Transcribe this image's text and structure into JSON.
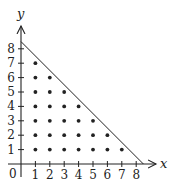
{
  "chart_data": {
    "type": "scatter",
    "title": "",
    "xlabel": "x",
    "ylabel": "y",
    "origin_label": "0",
    "xlim": [
      0,
      9
    ],
    "ylim": [
      0,
      9
    ],
    "grid": false,
    "x_ticks": [
      "1",
      "2",
      "3",
      "4",
      "5",
      "6",
      "7",
      "8"
    ],
    "y_ticks": [
      "1",
      "2",
      "3",
      "4",
      "5",
      "6",
      "7",
      "8"
    ],
    "line": {
      "description": "x + y = 8.5",
      "from": [
        0,
        8.5
      ],
      "to": [
        8.5,
        0
      ]
    },
    "points": [
      [
        1,
        1
      ],
      [
        2,
        1
      ],
      [
        3,
        1
      ],
      [
        4,
        1
      ],
      [
        5,
        1
      ],
      [
        6,
        1
      ],
      [
        7,
        1
      ],
      [
        1,
        2
      ],
      [
        2,
        2
      ],
      [
        3,
        2
      ],
      [
        4,
        2
      ],
      [
        5,
        2
      ],
      [
        6,
        2
      ],
      [
        1,
        3
      ],
      [
        2,
        3
      ],
      [
        3,
        3
      ],
      [
        4,
        3
      ],
      [
        5,
        3
      ],
      [
        1,
        4
      ],
      [
        2,
        4
      ],
      [
        3,
        4
      ],
      [
        4,
        4
      ],
      [
        1,
        5
      ],
      [
        2,
        5
      ],
      [
        3,
        5
      ],
      [
        1,
        6
      ],
      [
        2,
        6
      ],
      [
        1,
        7
      ]
    ]
  },
  "colors": {
    "ink": "#222222",
    "background": "#ffffff"
  }
}
